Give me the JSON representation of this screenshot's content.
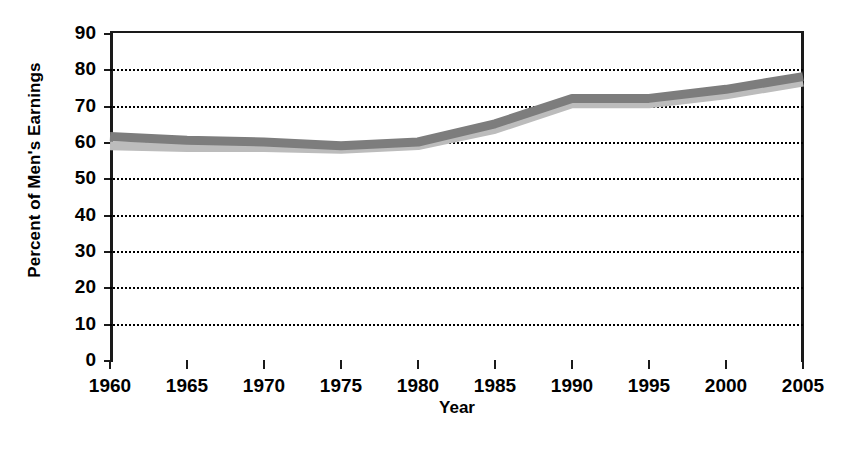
{
  "chart_data": {
    "type": "line",
    "title": "",
    "xlabel": "Year",
    "ylabel": "Percent of Men's Earnings",
    "xlim": [
      1960,
      2005
    ],
    "ylim": [
      0,
      90
    ],
    "grid": true,
    "legend": "none",
    "x": [
      1960,
      1965,
      1970,
      1975,
      1980,
      1985,
      1990,
      1995,
      2000,
      2005
    ],
    "xticklabels": [
      "1960",
      "1965",
      "1970",
      "1975",
      "1980",
      "1985",
      "1990",
      "1995",
      "2000",
      "2005"
    ],
    "yticks": [
      0,
      10,
      20,
      30,
      40,
      50,
      60,
      70,
      80,
      90
    ],
    "yticklabels": [
      "0",
      "10",
      "20",
      "30",
      "40",
      "50",
      "60",
      "70",
      "80",
      "90"
    ],
    "series": [
      {
        "name": "upper-band-line",
        "color": "#7d7d7d",
        "values": [
          61.5,
          60.5,
          60.0,
          59.0,
          60.0,
          65.0,
          72.0,
          72.0,
          74.5,
          78.0
        ]
      },
      {
        "name": "lower-band-line",
        "color": "#bcbcbc",
        "values": [
          59.0,
          58.5,
          58.5,
          58.0,
          59.0,
          63.5,
          70.5,
          70.5,
          73.0,
          76.5
        ]
      }
    ]
  },
  "axes": {
    "y_title": "Percent of Men's Earnings",
    "x_title": "Year"
  }
}
